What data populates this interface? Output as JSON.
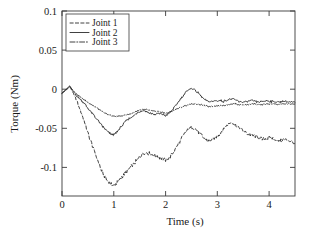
{
  "chart_data": {
    "type": "line",
    "title": "",
    "xlabel": "Time (s)",
    "ylabel": "Torque (Nm)",
    "xlim": [
      0,
      4.5
    ],
    "ylim": [
      -0.125,
      0.1
    ],
    "xticks": [
      0,
      1,
      2,
      3,
      4
    ],
    "xtick_labels": [
      "0",
      "1",
      "2",
      "3",
      "4"
    ],
    "yticks": [
      0.1,
      0.05,
      0,
      -0.05,
      -0.1
    ],
    "ytick_labels": [
      "0.1",
      "0.05",
      "0",
      "-0.05",
      "-0.1"
    ],
    "grid": false,
    "legend_position": "upper left",
    "series": [
      {
        "name": "Joint 1",
        "style": "dashed",
        "color": "#2b2b2b",
        "x": [
          0.0,
          0.08,
          0.15,
          0.22,
          0.3,
          0.38,
          0.45,
          0.52,
          0.6,
          0.68,
          0.75,
          0.82,
          0.9,
          0.95,
          1.0,
          1.05,
          1.1,
          1.18,
          1.25,
          1.32,
          1.4,
          1.48,
          1.55,
          1.62,
          1.7,
          1.78,
          1.85,
          1.92,
          2.0,
          2.08,
          2.15,
          2.22,
          2.3,
          2.38,
          2.45,
          2.52,
          2.6,
          2.68,
          2.75,
          2.82,
          2.9,
          2.98,
          3.05,
          3.12,
          3.2,
          3.28,
          3.35,
          3.42,
          3.5,
          3.58,
          3.65,
          3.72,
          3.8,
          3.88,
          3.95,
          4.02,
          4.1,
          4.18,
          4.25,
          4.32,
          4.4,
          4.5
        ],
        "y": [
          0.0,
          0.004,
          0.008,
          0.0,
          -0.012,
          -0.025,
          -0.038,
          -0.052,
          -0.066,
          -0.08,
          -0.092,
          -0.101,
          -0.108,
          -0.111,
          -0.112,
          -0.11,
          -0.106,
          -0.1,
          -0.095,
          -0.09,
          -0.085,
          -0.079,
          -0.074,
          -0.072,
          -0.073,
          -0.076,
          -0.077,
          -0.079,
          -0.082,
          -0.078,
          -0.072,
          -0.064,
          -0.056,
          -0.048,
          -0.043,
          -0.041,
          -0.045,
          -0.05,
          -0.055,
          -0.058,
          -0.057,
          -0.053,
          -0.049,
          -0.044,
          -0.038,
          -0.036,
          -0.038,
          -0.042,
          -0.046,
          -0.049,
          -0.051,
          -0.052,
          -0.054,
          -0.056,
          -0.055,
          -0.054,
          -0.056,
          -0.058,
          -0.057,
          -0.056,
          -0.058,
          -0.061
        ]
      },
      {
        "name": "Joint 2",
        "style": "solid",
        "color": "#2b2b2b",
        "x": [
          0.0,
          0.08,
          0.15,
          0.22,
          0.3,
          0.38,
          0.45,
          0.52,
          0.6,
          0.68,
          0.75,
          0.82,
          0.9,
          0.95,
          1.0,
          1.05,
          1.1,
          1.18,
          1.25,
          1.32,
          1.4,
          1.48,
          1.55,
          1.62,
          1.7,
          1.78,
          1.85,
          1.92,
          2.0,
          2.08,
          2.15,
          2.22,
          2.3,
          2.38,
          2.45,
          2.52,
          2.6,
          2.68,
          2.75,
          2.82,
          2.9,
          2.98,
          3.05,
          3.12,
          3.2,
          3.28,
          3.35,
          3.42,
          3.5,
          3.58,
          3.65,
          3.72,
          3.8,
          3.88,
          3.95,
          4.02,
          4.1,
          4.18,
          4.25,
          4.32,
          4.4,
          4.5
        ],
        "y": [
          0.0,
          0.005,
          0.009,
          0.002,
          -0.004,
          -0.009,
          -0.014,
          -0.02,
          -0.026,
          -0.032,
          -0.038,
          -0.043,
          -0.048,
          -0.05,
          -0.05,
          -0.048,
          -0.044,
          -0.038,
          -0.033,
          -0.03,
          -0.027,
          -0.023,
          -0.021,
          -0.022,
          -0.024,
          -0.026,
          -0.025,
          -0.025,
          -0.027,
          -0.024,
          -0.019,
          -0.013,
          -0.006,
          0.0,
          0.005,
          0.006,
          0.002,
          -0.003,
          -0.008,
          -0.01,
          -0.01,
          -0.009,
          -0.009,
          -0.01,
          -0.008,
          -0.007,
          -0.008,
          -0.01,
          -0.011,
          -0.01,
          -0.009,
          -0.01,
          -0.011,
          -0.01,
          -0.009,
          -0.01,
          -0.01,
          -0.011,
          -0.01,
          -0.01,
          -0.011,
          -0.011
        ]
      },
      {
        "name": "Joint 3",
        "style": "dashdot",
        "color": "#2b2b2b",
        "x": [
          0.0,
          0.08,
          0.15,
          0.22,
          0.3,
          0.38,
          0.45,
          0.52,
          0.6,
          0.68,
          0.75,
          0.82,
          0.9,
          0.95,
          1.0,
          1.05,
          1.1,
          1.18,
          1.25,
          1.32,
          1.4,
          1.48,
          1.55,
          1.62,
          1.7,
          1.78,
          1.85,
          1.92,
          2.0,
          2.08,
          2.15,
          2.22,
          2.3,
          2.38,
          2.45,
          2.52,
          2.6,
          2.68,
          2.75,
          2.82,
          2.9,
          2.98,
          3.05,
          3.12,
          3.2,
          3.28,
          3.35,
          3.42,
          3.5,
          3.58,
          3.65,
          3.72,
          3.8,
          3.88,
          3.95,
          4.02,
          4.1,
          4.18,
          4.25,
          4.32,
          4.4,
          4.5
        ],
        "y": [
          0.0,
          0.004,
          0.008,
          0.003,
          -0.002,
          -0.006,
          -0.009,
          -0.012,
          -0.015,
          -0.018,
          -0.021,
          -0.024,
          -0.026,
          -0.027,
          -0.028,
          -0.028,
          -0.028,
          -0.027,
          -0.026,
          -0.025,
          -0.023,
          -0.021,
          -0.02,
          -0.02,
          -0.021,
          -0.022,
          -0.022,
          -0.023,
          -0.024,
          -0.023,
          -0.021,
          -0.019,
          -0.017,
          -0.015,
          -0.014,
          -0.013,
          -0.013,
          -0.014,
          -0.015,
          -0.016,
          -0.016,
          -0.015,
          -0.015,
          -0.015,
          -0.014,
          -0.013,
          -0.013,
          -0.014,
          -0.014,
          -0.014,
          -0.013,
          -0.013,
          -0.014,
          -0.014,
          -0.013,
          -0.013,
          -0.013,
          -0.014,
          -0.013,
          -0.013,
          -0.013,
          -0.013
        ]
      }
    ]
  },
  "axes": {
    "xlabel": "Time (s)",
    "ylabel": "Torque (Nm)"
  },
  "legend": {
    "items": [
      {
        "label": "Joint 1"
      },
      {
        "label": "Joint 2"
      },
      {
        "label": "Joint 3"
      }
    ]
  },
  "ticks": {
    "x": [
      "0",
      "1",
      "2",
      "3",
      "4"
    ],
    "y": [
      "0.1",
      "0.05",
      "0",
      "-0.05",
      "-0.1"
    ]
  }
}
